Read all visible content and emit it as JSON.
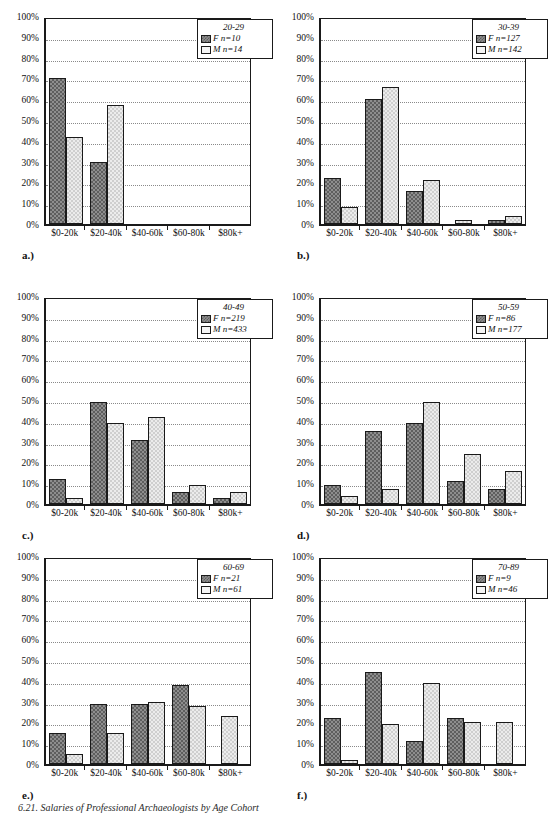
{
  "figure": {
    "caption": "6.21.  Salaries of Professional Archaeologists by Age Cohort",
    "y_ticks": [
      "100%",
      "90%",
      "80%",
      "70%",
      "60%",
      "50%",
      "40%",
      "30%",
      "20%",
      "10%",
      "0%"
    ],
    "x_categories": [
      "$0-20k",
      "$20-40k",
      "$40-60k",
      "$60-80k",
      "$80k+"
    ],
    "series_labels": {
      "female": "F",
      "male": "M"
    },
    "colors": {
      "female_fill": "#8e8e8e",
      "female_hatch": "#5e5e5e",
      "male_fill": "#ececec",
      "male_hatch": "#cfcfcf",
      "axis": "#1a1a1a",
      "grid": "#8a8a8a"
    }
  },
  "chart_data": [
    {
      "type": "bar",
      "panel": "a.)",
      "title": "20-29",
      "categories": [
        "$0-20k",
        "$20-40k",
        "$40-60k",
        "$60-80k",
        "$80k+"
      ],
      "series": [
        {
          "name": "F",
          "legend": "F n=10",
          "n": 10,
          "values": [
            70,
            30,
            0,
            0,
            0
          ]
        },
        {
          "name": "M",
          "legend": "M n=14",
          "n": 14,
          "values": [
            42,
            57,
            0,
            0,
            0
          ]
        }
      ],
      "xlabel": "",
      "ylabel": "",
      "ylim": [
        0,
        100
      ],
      "grid": true,
      "legend_position": "top-right"
    },
    {
      "type": "bar",
      "panel": "b.)",
      "title": "30-39",
      "categories": [
        "$0-20k",
        "$20-40k",
        "$40-60k",
        "$60-80k",
        "$80k+"
      ],
      "series": [
        {
          "name": "F",
          "legend": "F n=127",
          "n": 127,
          "values": [
            22,
            60,
            16,
            0,
            2
          ]
        },
        {
          "name": "M",
          "legend": "M n=142",
          "n": 142,
          "values": [
            8,
            66,
            21,
            2,
            4
          ]
        }
      ],
      "xlabel": "",
      "ylabel": "",
      "ylim": [
        0,
        100
      ],
      "grid": true,
      "legend_position": "top-right"
    },
    {
      "type": "bar",
      "panel": "c.)",
      "title": "40-49",
      "categories": [
        "$0-20k",
        "$20-40k",
        "$40-60k",
        "$60-80k",
        "$80k+"
      ],
      "series": [
        {
          "name": "F",
          "legend": "F n=219",
          "n": 219,
          "values": [
            12,
            49,
            31,
            6,
            3
          ]
        },
        {
          "name": "M",
          "legend": "M n=433",
          "n": 433,
          "values": [
            3,
            39,
            42,
            9,
            6
          ]
        }
      ],
      "xlabel": "",
      "ylabel": "",
      "ylim": [
        0,
        100
      ],
      "grid": true,
      "legend_position": "top-right"
    },
    {
      "type": "bar",
      "panel": "d.)",
      "title": "50-59",
      "categories": [
        "$0-20k",
        "$20-40k",
        "$40-60k",
        "$60-80k",
        "$80k+"
      ],
      "series": [
        {
          "name": "F",
          "legend": "F n=86",
          "n": 86,
          "values": [
            9,
            35,
            39,
            11,
            7
          ]
        },
        {
          "name": "M",
          "legend": "M n=177",
          "n": 177,
          "values": [
            4,
            7,
            49,
            24,
            16
          ]
        }
      ],
      "xlabel": "",
      "ylabel": "",
      "ylim": [
        0,
        100
      ],
      "grid": true,
      "legend_position": "top-right"
    },
    {
      "type": "bar",
      "panel": "e.)",
      "title": "60-69",
      "categories": [
        "$0-20k",
        "$20-40k",
        "$40-60k",
        "$60-80k",
        "$80k+"
      ],
      "series": [
        {
          "name": "F",
          "legend": "F n=21",
          "n": 21,
          "values": [
            15,
            29,
            29,
            38,
            0
          ]
        },
        {
          "name": "M",
          "legend": "M n=61",
          "n": 61,
          "values": [
            5,
            15,
            30,
            28,
            23
          ]
        }
      ],
      "xlabel": "",
      "ylabel": "",
      "ylim": [
        0,
        100
      ],
      "grid": true,
      "legend_position": "top-right"
    },
    {
      "type": "bar",
      "panel": "f.)",
      "title": "70-89",
      "categories": [
        "$0-20k",
        "$20-40k",
        "$40-60k",
        "$60-80k",
        "$80k+"
      ],
      "series": [
        {
          "name": "F",
          "legend": "F n=9",
          "n": 9,
          "values": [
            22,
            44,
            11,
            22,
            0
          ]
        },
        {
          "name": "M",
          "legend": "M n=46",
          "n": 46,
          "values": [
            2,
            19,
            39,
            20,
            20
          ]
        }
      ],
      "xlabel": "",
      "ylabel": "",
      "ylim": [
        0,
        100
      ],
      "grid": true,
      "legend_position": "top-right"
    }
  ]
}
